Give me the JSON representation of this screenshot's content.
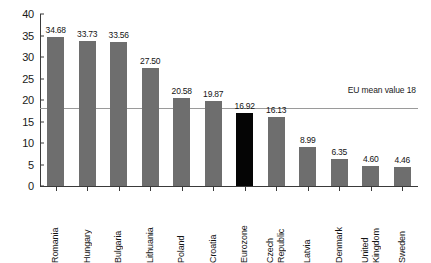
{
  "chart_data": {
    "type": "bar",
    "title": "",
    "subtitle": "",
    "xlabel": "",
    "ylabel": "",
    "ylim": [
      0,
      40
    ],
    "yticks": [
      "0",
      "5",
      "10",
      "15",
      "20",
      "25",
      "30",
      "35",
      "40"
    ],
    "grid": false,
    "legend_position": "none",
    "categories": [
      "Romania",
      "Hungary",
      "Bulgaria",
      "Lithuania",
      "Poland",
      "Croatia",
      "Eurozone",
      "Czech Republic",
      "Latvia",
      "Denmark",
      "United Kingdom",
      "Sweden"
    ],
    "category_lines": [
      [
        "Romania"
      ],
      [
        "Hungary"
      ],
      [
        "Bulgaria"
      ],
      [
        "Lithuania"
      ],
      [
        "Poland"
      ],
      [
        "Croatia"
      ],
      [
        "Eurozone"
      ],
      [
        "Czech",
        "Republic"
      ],
      [
        "Latvia"
      ],
      [
        "Denmark"
      ],
      [
        "United",
        "Kingdom"
      ],
      [
        "Sweden"
      ]
    ],
    "values": [
      34.68,
      33.73,
      33.56,
      27.5,
      20.58,
      19.87,
      16.92,
      16.13,
      8.99,
      6.35,
      4.6,
      4.46
    ],
    "value_labels": [
      "34.68",
      "33.73",
      "33.56",
      "27.50",
      "20.58",
      "19.87",
      "16.92",
      "16.13",
      "8.99",
      "6.35",
      "4.60",
      "4.46"
    ],
    "highlight_index": 6,
    "annotations": [
      {
        "name": "eu-mean-line",
        "label": "EU mean value 18",
        "value": 18
      }
    ],
    "colors": {
      "bar": "#6e6e6e",
      "bar_highlight": "#050505",
      "axis": "#3a3a3a",
      "mean_line": "#9a9a9a",
      "text": "#141414",
      "background": "#ffffff"
    }
  }
}
